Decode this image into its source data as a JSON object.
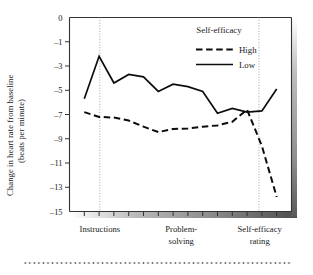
{
  "chart_data": {
    "type": "line",
    "title": "",
    "xlabel": "",
    "ylabel": "Change in heart rate from baseline (beats per minute)",
    "ylabel_line1": "Change in heart rate from baseline",
    "ylabel_line2": "(beats per minute)",
    "ylim": [
      -15,
      0
    ],
    "ytick_labels": [
      "0",
      "–1",
      "–3",
      "–5",
      "–7",
      "–9",
      "–11",
      "–13",
      "–15"
    ],
    "ytick_values": [
      0,
      -1,
      -3,
      -5,
      -7,
      -9,
      -11,
      -13,
      -15
    ],
    "grid": false,
    "xlim": [
      0,
      15
    ],
    "x": [
      1,
      2,
      3,
      4,
      5,
      6,
      7,
      8,
      9,
      10,
      11,
      12,
      13,
      14
    ],
    "xtick_positions": [
      1,
      2,
      3,
      4,
      5,
      6,
      7,
      8,
      9,
      10,
      11,
      12,
      13,
      14
    ],
    "category_labels": [
      {
        "text": "Instructions",
        "x": 2.05,
        "line2": ""
      },
      {
        "text": "Problem-",
        "x": 7.55,
        "line2": "solving"
      },
      {
        "text": "Self-efficacy",
        "x": 12.85,
        "line2": "rating"
      }
    ],
    "phase_markers": [
      {
        "name": "instructions-divider",
        "x": 2.05
      },
      {
        "name": "self-efficacy-rating-divider",
        "x": 12.8
      }
    ],
    "legend": {
      "title": "Self-efficacy",
      "position": "top-right",
      "entries": [
        {
          "name": "High",
          "style": "dashed"
        },
        {
          "name": "Low",
          "style": "solid"
        }
      ]
    },
    "series": [
      {
        "name": "High",
        "style": "dashed",
        "color": "#0d0d0d",
        "values": [
          -6.8,
          -7.2,
          -7.25,
          -7.5,
          -8.0,
          -8.45,
          -8.2,
          -8.15,
          -8.0,
          -7.9,
          -7.6,
          -6.6,
          -9.6,
          -13.8
        ]
      },
      {
        "name": "Low",
        "style": "solid",
        "color": "#0d0d0d",
        "values": [
          -5.7,
          -2.2,
          -4.4,
          -3.7,
          -3.9,
          -5.1,
          -4.5,
          -4.7,
          -5.1,
          -6.9,
          -6.5,
          -6.8,
          -6.7,
          -4.9
        ]
      }
    ]
  },
  "colors": {
    "line": "#0d0d0d",
    "axis": "#333333",
    "divider": "#9a9a9a",
    "background": "#ffffff",
    "footer_dots": "#6e6e6e"
  }
}
